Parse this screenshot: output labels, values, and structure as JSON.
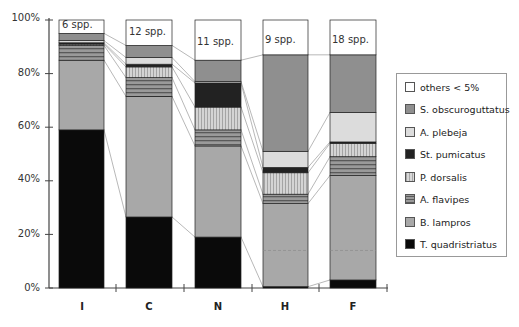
{
  "chart_data": {
    "type": "bar",
    "stacked": true,
    "title": "",
    "xlabel": "",
    "ylabel": "",
    "ylim": [
      0,
      100
    ],
    "y_ticks": [
      "0%",
      "20%",
      "40%",
      "60%",
      "80%",
      "100%"
    ],
    "categories": [
      "I",
      "C",
      "N",
      "H",
      "F"
    ],
    "bar_annotations": [
      "6 spp.",
      "12 spp.",
      "11 spp.",
      "9 spp.",
      "18 spp."
    ],
    "series": [
      {
        "name": "T. quadristriatus",
        "color": "#0a0a0a",
        "values": [
          59,
          26.5,
          19,
          0.5,
          3
        ]
      },
      {
        "name": "B. lampros",
        "color": "#a8a8a8",
        "values": [
          26,
          45,
          34,
          31,
          39
        ]
      },
      {
        "name": "A. flavipes",
        "color": "#7a7a7a",
        "pattern": "horizontal-stripes",
        "values": [
          5.5,
          7,
          6,
          3.5,
          7
        ]
      },
      {
        "name": "P. dorsalis",
        "color": "#c4c4c4",
        "pattern": "vertical-stripes",
        "values": [
          0.5,
          4,
          8.5,
          8,
          5
        ]
      },
      {
        "name": "St. pumicatus",
        "color": "#222222",
        "values": [
          0.5,
          1,
          9,
          2,
          0.5
        ]
      },
      {
        "name": "A. plebeja",
        "color": "#dcdcdc",
        "values": [
          0.8,
          2.5,
          0.5,
          6,
          11
        ]
      },
      {
        "name": "S. obscuroguttatus",
        "color": "#8f8f8f",
        "values": [
          2.7,
          4.5,
          8,
          36,
          21.5
        ]
      },
      {
        "name": "others < 5%",
        "color": "#ffffff",
        "values": [
          5,
          9.5,
          15,
          13,
          13
        ]
      }
    ],
    "connector_lines": true,
    "grid": false,
    "legend_position": "right"
  },
  "legend": {
    "items": [
      {
        "label": "others < 5%",
        "color": "#ffffff"
      },
      {
        "label": "S. obscuroguttatus",
        "color": "#8f8f8f"
      },
      {
        "label": "A. plebeja",
        "color": "#dcdcdc"
      },
      {
        "label": "St. pumicatus",
        "color": "#222222"
      },
      {
        "label": "P. dorsalis",
        "color": "#c4c4c4"
      },
      {
        "label": "A. flavipes",
        "color": "#7a7a7a"
      },
      {
        "label": "B. lampros",
        "color": "#a8a8a8"
      },
      {
        "label": "T. quadristriatus",
        "color": "#0a0a0a"
      }
    ]
  }
}
